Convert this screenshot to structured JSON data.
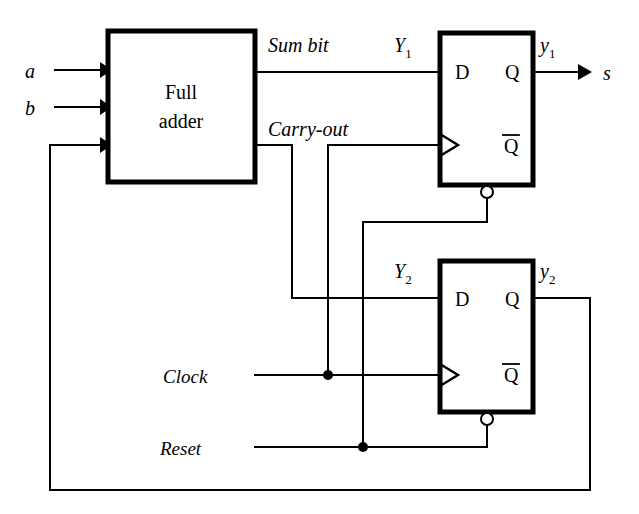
{
  "diagram": {
    "colors": {
      "ink": "#000000",
      "paper": "#ffffff"
    },
    "blocks": [
      {
        "id": "full-adder",
        "line1": "Full",
        "line2": "adder"
      },
      {
        "id": "flip-flop-1",
        "d_label": "D",
        "q_label": "Q",
        "qbar_label": "Q"
      },
      {
        "id": "flip-flop-2",
        "d_label": "D",
        "q_label": "Q",
        "qbar_label": "Q"
      }
    ],
    "inputs": [
      {
        "id": "input-a",
        "label": "a"
      },
      {
        "id": "input-b",
        "label": "b"
      },
      {
        "id": "input-clock",
        "label": "Clock"
      },
      {
        "id": "input-reset",
        "label": "Reset"
      }
    ],
    "outputs": [
      {
        "id": "output-s",
        "label": "s"
      }
    ],
    "signals": [
      {
        "id": "sum-bit",
        "label": "Sum bit"
      },
      {
        "id": "carry-out",
        "label": "Carry-out"
      },
      {
        "id": "y-big-1",
        "label": "Y",
        "subscript": "1"
      },
      {
        "id": "y-big-2",
        "label": "Y",
        "subscript": "2"
      },
      {
        "id": "y-small-1",
        "label": "y",
        "subscript": "1"
      },
      {
        "id": "y-small-2",
        "label": "y",
        "subscript": "2"
      }
    ]
  }
}
